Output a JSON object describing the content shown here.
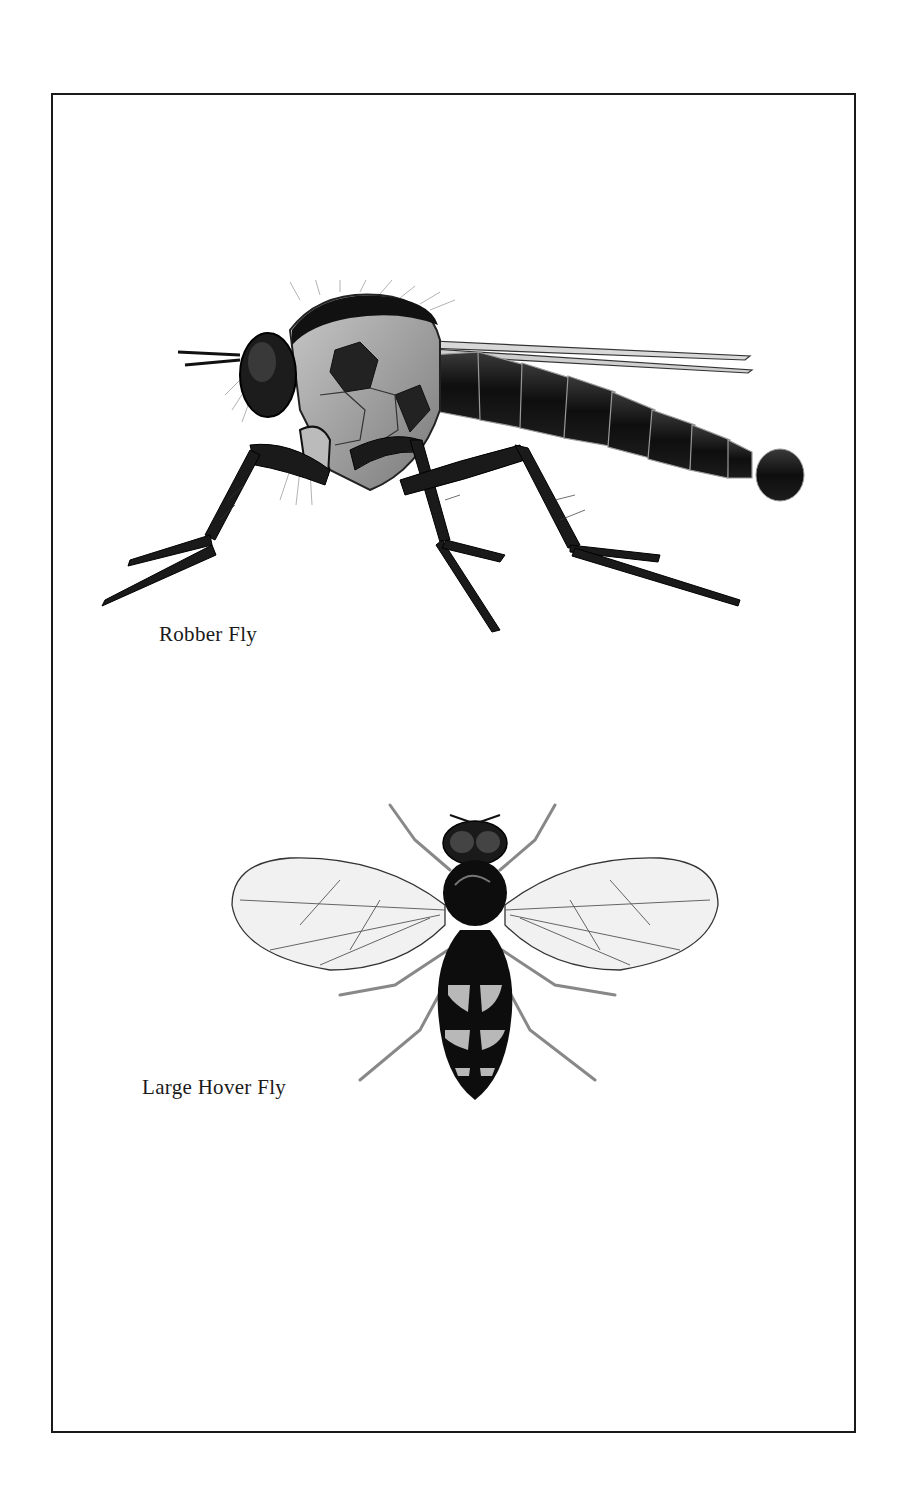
{
  "page": {
    "frame_color": "#1a1a1a",
    "background": "#ffffff"
  },
  "illustrations": [
    {
      "id": "robber-fly",
      "caption": "Robber Fly",
      "view": "side"
    },
    {
      "id": "large-hover-fly",
      "caption": "Large Hover Fly",
      "view": "dorsal"
    }
  ]
}
